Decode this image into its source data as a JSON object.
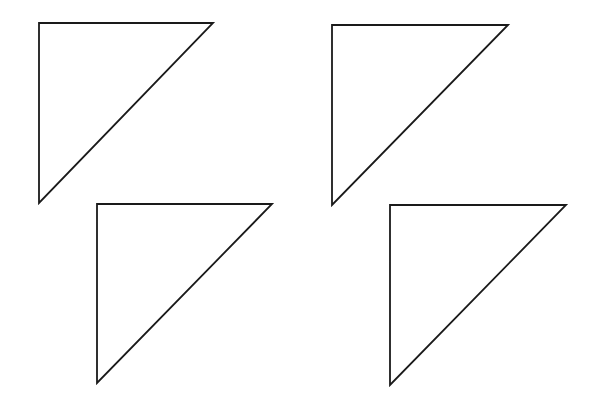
{
  "canvas": {
    "width": 599,
    "height": 400,
    "background": "#ffffff"
  },
  "stroke": {
    "color": "#1a1a1a",
    "width": 1.8
  },
  "shapes": [
    {
      "id": "triangle-top-left",
      "type": "right-triangle",
      "points": [
        [
          39,
          23
        ],
        [
          213,
          23
        ],
        [
          39,
          203
        ]
      ]
    },
    {
      "id": "triangle-top-right",
      "type": "right-triangle",
      "points": [
        [
          332,
          25
        ],
        [
          508,
          25
        ],
        [
          332,
          205
        ]
      ]
    },
    {
      "id": "triangle-bottom-left",
      "type": "right-triangle",
      "points": [
        [
          97,
          204
        ],
        [
          272,
          204
        ],
        [
          97,
          383
        ]
      ]
    },
    {
      "id": "triangle-bottom-right",
      "type": "right-triangle",
      "points": [
        [
          390,
          205
        ],
        [
          566,
          205
        ],
        [
          390,
          385
        ]
      ]
    }
  ]
}
